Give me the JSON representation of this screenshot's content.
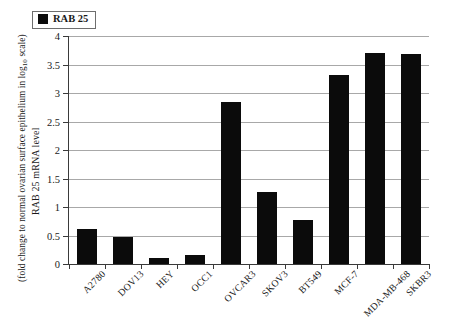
{
  "chart_data": {
    "type": "bar",
    "title": "",
    "subtitle": "",
    "xlabel": "",
    "ylabel_line1": "RAB 25 mRNA level",
    "ylabel_line2_pre": "(fold change to normal ovarian surface epithelium in log",
    "ylabel_line2_sub": "10",
    "ylabel_line2_post": " scale)",
    "categories": [
      "A2780",
      "DOV13",
      "HEY",
      "OCC1",
      "OVCAR3",
      "SKOV3",
      "BT549",
      "MCF-7",
      "MDA-MB-468",
      "SKBR3"
    ],
    "values": [
      0.62,
      0.47,
      0.1,
      0.16,
      2.84,
      1.26,
      0.78,
      3.32,
      3.7,
      3.68
    ],
    "series": [
      {
        "name": "RAB 25",
        "values": [
          0.62,
          0.47,
          0.1,
          0.16,
          2.84,
          1.26,
          0.78,
          3.32,
          3.7,
          3.68
        ]
      }
    ],
    "ylim": [
      0,
      4
    ],
    "ytick_labels": [
      "4",
      "3.5",
      "3",
      "2.5",
      "2",
      "1.5",
      "1",
      "0.5",
      "0"
    ],
    "ytick_values": [
      4,
      3.5,
      3,
      2.5,
      2,
      1.5,
      1,
      0.5,
      0
    ],
    "grid": true,
    "legend_position": "top-left",
    "legend": [
      {
        "label": "RAB 25",
        "color": "#0b0b0b"
      }
    ],
    "bar_color": "#0b0b0b",
    "gridline_color": "#a8a8a8",
    "axis_color": "#3a3a3a",
    "background": "#ffffff"
  }
}
